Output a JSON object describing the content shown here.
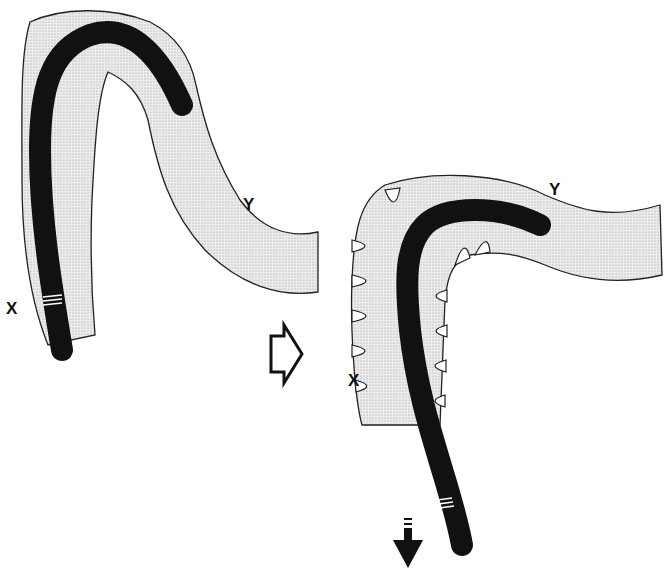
{
  "diagram": {
    "type": "medical-illustration",
    "panels": [
      {
        "id": "before",
        "labels": {
          "x": "X",
          "y": "Y"
        }
      },
      {
        "id": "after",
        "labels": {
          "x": "X",
          "y": "Y"
        }
      }
    ],
    "transition_arrow": "open-right-arrow",
    "withdraw_arrow": "down-arrow",
    "colors": {
      "scope": "#111111",
      "colon_fill": "#e6e6e6",
      "colon_outline": "#222222",
      "background": "#ffffff"
    }
  }
}
